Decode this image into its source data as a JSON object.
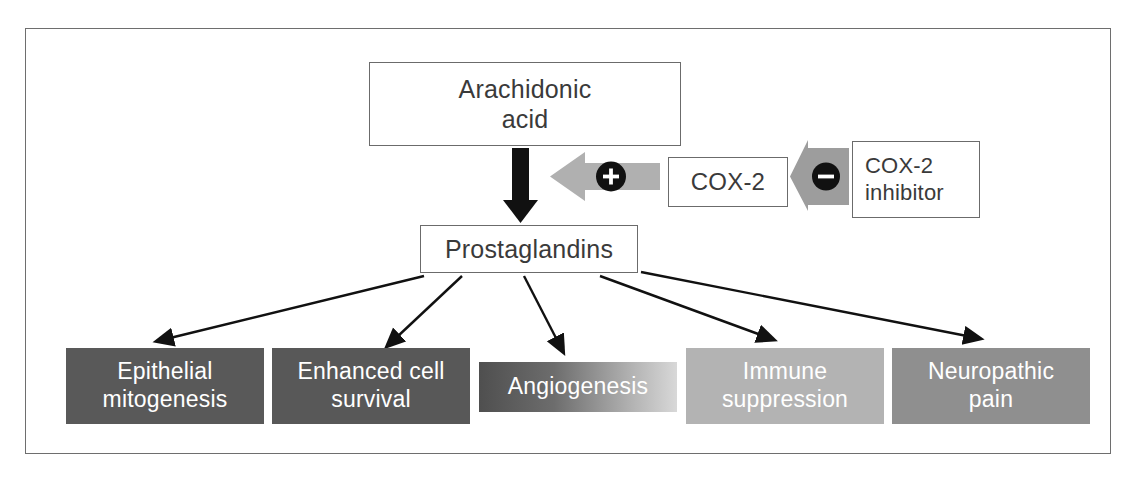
{
  "diagram": {
    "nodes": {
      "arachidonic_acid": "Arachidonic\nacid",
      "arachidonic_acid_line1": "Arachidonic",
      "arachidonic_acid_line2": "acid",
      "cox2": "COX-2",
      "cox2_inhibitor_line1": "COX-2",
      "cox2_inhibitor_line2": "inhibitor",
      "prostaglandins": "Prostaglandins"
    },
    "signs": {
      "positive": "+",
      "negative": "–"
    },
    "outcomes": [
      {
        "line1": "Epithelial",
        "line2": "mitogenesis",
        "shade": "#595959"
      },
      {
        "line1": "Enhanced cell",
        "line2": "survival",
        "shade": "#585858"
      },
      {
        "line1": "Angiogenesis",
        "line2": "",
        "shade": "gradient-dark-to-light"
      },
      {
        "line1": "Immune",
        "line2": "suppression",
        "shade": "#b3b3b3"
      },
      {
        "line1": "Neuropathic",
        "line2": "pain",
        "shade": "#8f8f8f"
      }
    ],
    "colors": {
      "frame_border": "#6e6e6e",
      "node_border": "#6b6b6b",
      "node_text": "#3a3a3a",
      "arrow_black": "#111111",
      "arrow_gray": "#b0b0b0",
      "outcome_text": "#ffffff"
    },
    "caption": ""
  }
}
